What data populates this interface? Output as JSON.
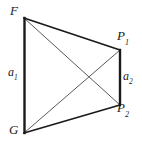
{
  "figure": {
    "type": "geometry-diagram",
    "background_color": "#ffffff",
    "stroke_color": "#1a1a1a",
    "thin_stroke_color": "#555555",
    "vertices": [
      {
        "id": "F",
        "label": "F",
        "sub": "",
        "x": 24,
        "y": 18
      },
      {
        "id": "P1",
        "label": "P",
        "sub": "1",
        "x": 120,
        "y": 50
      },
      {
        "id": "P2",
        "label": "P",
        "sub": "2",
        "x": 120,
        "y": 105
      },
      {
        "id": "G",
        "label": "G",
        "sub": "",
        "x": 24,
        "y": 133
      }
    ],
    "sides": [
      {
        "id": "a1",
        "label": "a",
        "sub": "1",
        "from": "F",
        "to": "G",
        "weight": "thick"
      },
      {
        "id": "a2",
        "label": "a",
        "sub": "2",
        "from": "P1",
        "to": "P2",
        "weight": "thick"
      },
      {
        "id": "top",
        "label": "",
        "sub": "",
        "from": "F",
        "to": "P1",
        "weight": "thick"
      },
      {
        "id": "bottom",
        "label": "",
        "sub": "",
        "from": "G",
        "to": "P2",
        "weight": "thick"
      }
    ],
    "diagonals": [
      {
        "id": "d1",
        "from": "F",
        "to": "P2",
        "weight": "thin"
      },
      {
        "id": "d2",
        "from": "G",
        "to": "P1",
        "weight": "thin"
      }
    ],
    "intersection": {
      "x": 87,
      "y": 80
    }
  }
}
